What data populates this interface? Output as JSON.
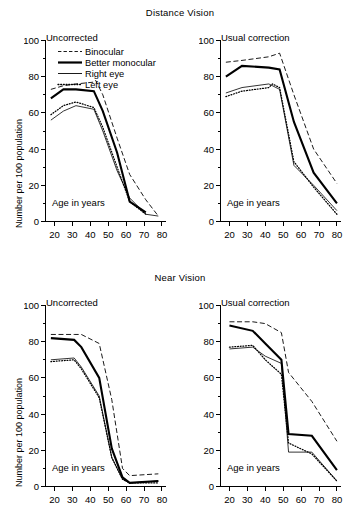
{
  "figure": {
    "ylabel": "Number per 100 population",
    "xlabel": "Age in years",
    "sections": [
      {
        "title": "Distance Vision"
      },
      {
        "title": "Near Vision"
      }
    ],
    "panel_captions": {
      "uncorrected": "Uncorrected",
      "usual_correction": "Usual correction"
    },
    "legend": {
      "entries": [
        {
          "label": "Binocular",
          "style": "dashed"
        },
        {
          "label": "Better monocular",
          "style": "thick-solid"
        },
        {
          "label": "Right eye",
          "style": "thin-solid"
        },
        {
          "label": "Left eye",
          "style": "dotted"
        }
      ]
    },
    "axis": {
      "y_ticks_labeled": [
        "0",
        "20",
        "40",
        "60",
        "80",
        "100"
      ],
      "y_ticks_all": [
        0,
        10,
        20,
        30,
        40,
        50,
        60,
        70,
        80,
        90,
        100
      ],
      "x_ticks_labeled": [
        "20",
        "30",
        "40",
        "50",
        "60",
        "70",
        "80"
      ],
      "ylim": [
        0,
        100
      ],
      "xlim": [
        15,
        82
      ]
    }
  },
  "chart_data": [
    {
      "type": "line",
      "title": "Distance Vision — Uncorrected",
      "panel": "Uncorrected",
      "group": "Distance Vision",
      "xlabel": "Age in years",
      "ylabel": "Number per 100 population",
      "xlim": [
        15,
        82
      ],
      "ylim": [
        0,
        100
      ],
      "grid": false,
      "legend_position": "inside-top-left",
      "x": [
        18,
        25,
        32,
        42,
        47,
        55,
        62,
        71,
        78
      ],
      "series": [
        {
          "name": "Binocular",
          "style": "dashed",
          "x": [
            18,
            25,
            32,
            42,
            43,
            47,
            55,
            62,
            71,
            78
          ],
          "values": [
            73,
            75,
            76,
            77,
            78,
            70,
            46,
            26,
            12,
            3
          ]
        },
        {
          "name": "Better monocular",
          "style": "thick-solid",
          "x": [
            18,
            25,
            32,
            42,
            47,
            55,
            62,
            71
          ],
          "values": [
            68,
            73,
            73,
            72,
            61,
            38,
            11,
            5
          ]
        },
        {
          "name": "Right eye",
          "style": "thin-solid",
          "x": [
            18,
            25,
            32,
            42,
            47,
            55,
            62,
            71,
            78
          ],
          "values": [
            56,
            61,
            64,
            62,
            50,
            28,
            13,
            4,
            3
          ]
        },
        {
          "name": "Left eye",
          "style": "dotted",
          "x": [
            18,
            25,
            32,
            42,
            47,
            55,
            62,
            71
          ],
          "values": [
            59,
            64,
            66,
            63,
            52,
            30,
            11,
            4
          ]
        }
      ]
    },
    {
      "type": "line",
      "title": "Distance Vision — Usual correction",
      "panel": "Usual correction",
      "group": "Distance Vision",
      "xlabel": "Age in years",
      "ylabel": "Number per 100 population",
      "xlim": [
        15,
        82
      ],
      "ylim": [
        0,
        100
      ],
      "grid": false,
      "legend_position": "none",
      "x": [
        18,
        27,
        42,
        48,
        56,
        67,
        80
      ],
      "series": [
        {
          "name": "Binocular",
          "style": "dashed",
          "x": [
            18,
            27,
            42,
            48,
            56,
            67,
            80
          ],
          "values": [
            88,
            89,
            91,
            93,
            70,
            40,
            21
          ]
        },
        {
          "name": "Better monocular",
          "style": "thick-solid",
          "x": [
            18,
            27,
            42,
            48,
            56,
            67,
            80
          ],
          "values": [
            80,
            86,
            85,
            84,
            55,
            27,
            10
          ]
        },
        {
          "name": "Right eye",
          "style": "thin-solid",
          "x": [
            18,
            27,
            42,
            48,
            56,
            67,
            80
          ],
          "values": [
            71,
            74,
            76,
            73,
            31,
            20,
            6
          ]
        },
        {
          "name": "Left eye",
          "style": "dotted",
          "x": [
            18,
            27,
            42,
            44,
            48,
            56,
            67,
            80
          ],
          "values": [
            69,
            72,
            74,
            76,
            74,
            33,
            19,
            4
          ]
        }
      ]
    },
    {
      "type": "line",
      "title": "Near Vision — Uncorrected",
      "panel": "Uncorrected",
      "group": "Near Vision",
      "xlabel": "Age in years",
      "ylabel": "Number per 100 population",
      "xlim": [
        15,
        82
      ],
      "ylim": [
        0,
        100
      ],
      "grid": false,
      "legend_position": "none",
      "x": [
        18,
        31,
        35,
        45,
        52,
        58,
        62,
        78
      ],
      "series": [
        {
          "name": "Binocular",
          "style": "dashed",
          "x": [
            18,
            31,
            35,
            45,
            52,
            58,
            62,
            78
          ],
          "values": [
            84,
            84,
            84,
            79,
            48,
            10,
            6,
            7
          ]
        },
        {
          "name": "Better monocular",
          "style": "thick-solid",
          "x": [
            18,
            31,
            35,
            45,
            52,
            58,
            62,
            78
          ],
          "values": [
            82,
            81,
            77,
            60,
            21,
            5,
            2,
            3
          ]
        },
        {
          "name": "Right eye",
          "style": "thin-solid",
          "x": [
            18,
            31,
            35,
            45,
            52,
            58,
            62,
            78
          ],
          "values": [
            70,
            71,
            66,
            50,
            16,
            4,
            2,
            3
          ]
        },
        {
          "name": "Left eye",
          "style": "dotted",
          "x": [
            18,
            31,
            35,
            45,
            52,
            58,
            62,
            78
          ],
          "values": [
            69,
            70,
            65,
            49,
            16,
            4,
            2,
            2
          ]
        }
      ]
    },
    {
      "type": "line",
      "title": "Near Vision — Usual correction",
      "panel": "Usual correction",
      "group": "Near Vision",
      "xlabel": "Age in years",
      "ylabel": "Number per 100 population",
      "xlim": [
        15,
        82
      ],
      "ylim": [
        0,
        100
      ],
      "grid": false,
      "legend_position": "none",
      "x": [
        20,
        33,
        40,
        49,
        53,
        66,
        80
      ],
      "series": [
        {
          "name": "Binocular",
          "style": "dashed",
          "x": [
            20,
            33,
            40,
            49,
            53,
            66,
            80
          ],
          "values": [
            91,
            91,
            90,
            85,
            63,
            47,
            25
          ]
        },
        {
          "name": "Better monocular",
          "style": "thick-solid",
          "x": [
            20,
            33,
            40,
            49,
            53,
            66,
            80
          ],
          "values": [
            89,
            86,
            79,
            70,
            29,
            28,
            9
          ]
        },
        {
          "name": "Right eye",
          "style": "thin-solid",
          "x": [
            20,
            33,
            40,
            49,
            53,
            66,
            80
          ],
          "values": [
            76,
            77,
            72,
            68,
            19,
            19,
            3
          ]
        },
        {
          "name": "Left eye",
          "style": "dotted",
          "x": [
            20,
            33,
            40,
            49,
            53,
            66,
            80
          ],
          "values": [
            77,
            78,
            70,
            62,
            24,
            18,
            3
          ]
        }
      ]
    }
  ]
}
